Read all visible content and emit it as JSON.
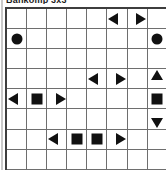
{
  "page": {
    "title": "Bankomp 3x3",
    "background_color": "#ffffff",
    "ink_color": "#111111",
    "grid_line_color": "#6e6e6e",
    "grid_border_color": "#3d3d3d"
  },
  "grid": {
    "columns": 8,
    "rows": 8,
    "cell_size_px": 19,
    "legend": {
      "circle": "filled-circle",
      "square": "filled-square",
      "tri-left": "left-pointing-triangle",
      "tri-right": "right-pointing-triangle",
      "tri-up": "up-pointing-triangle",
      "tri-down": "down-pointing-triangle",
      "empty": "empty-cell"
    },
    "cells": [
      [
        "empty",
        "empty",
        "empty",
        "empty",
        "empty",
        "tri-left-edge-right",
        "tri-right-edge-left",
        "empty"
      ],
      [
        "circle",
        "empty",
        "empty",
        "empty",
        "empty",
        "empty",
        "empty",
        "circle"
      ],
      [
        "empty",
        "empty",
        "empty",
        "empty",
        "empty",
        "empty",
        "empty",
        "empty"
      ],
      [
        "empty",
        "empty",
        "empty",
        "empty",
        "tri-left-edge-right",
        "tri-right-edge-left",
        "empty",
        "tri-up-edge-down"
      ],
      [
        "tri-left-edge-right",
        "square",
        "tri-right-edge-left",
        "empty",
        "empty",
        "empty",
        "empty",
        "square"
      ],
      [
        "empty",
        "empty",
        "empty",
        "empty",
        "empty",
        "empty",
        "empty",
        "tri-down-edge-up"
      ],
      [
        "empty",
        "empty",
        "tri-left-edge-right",
        "square",
        "square",
        "tri-right-edge-left",
        "empty",
        "empty"
      ],
      [
        "empty",
        "empty",
        "empty",
        "empty",
        "empty",
        "empty",
        "empty",
        "empty"
      ],
      [
        "tri-left-edge-right",
        "tri-right-edge-left",
        "empty",
        "empty",
        "circle",
        "empty",
        "empty",
        "circle"
      ]
    ]
  }
}
